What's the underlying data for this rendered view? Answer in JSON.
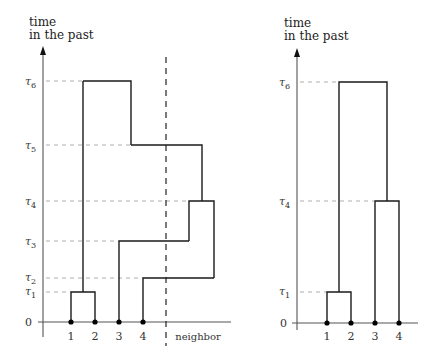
{
  "panels": [
    {
      "id": "left",
      "axis_title_line1": "time",
      "axis_title_line2": "in the past",
      "zero_label": "0",
      "tau_labels": [
        {
          "name": "τ",
          "sub": "1",
          "y": 292
        },
        {
          "name": "τ",
          "sub": "2",
          "y": 278
        },
        {
          "name": "τ",
          "sub": "3",
          "y": 241
        },
        {
          "name": "τ",
          "sub": "4",
          "y": 201
        },
        {
          "name": "τ",
          "sub": "5",
          "y": 145
        },
        {
          "name": "τ",
          "sub": "6",
          "y": 81
        }
      ],
      "leaves": [
        "1",
        "2",
        "3",
        "4"
      ],
      "neighbor_label": "neighbor"
    },
    {
      "id": "right",
      "axis_title_line1": "time",
      "axis_title_line2": "in the past",
      "zero_label": "0",
      "tau_labels": [
        {
          "name": "τ",
          "sub": "1",
          "y": 292
        },
        {
          "name": "τ",
          "sub": "4",
          "y": 201
        },
        {
          "name": "τ",
          "sub": "6",
          "y": 82
        }
      ],
      "leaves": [
        "1",
        "2",
        "3",
        "4"
      ]
    }
  ]
}
